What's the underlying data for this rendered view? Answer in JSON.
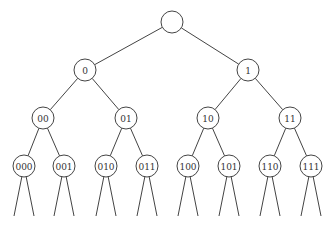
{
  "diagram": {
    "type": "binary-tree",
    "node_radius": 11,
    "nodes": [
      {
        "id": "root",
        "label": "",
        "x": 172,
        "y": 22
      },
      {
        "id": "0",
        "label": "0",
        "x": 85,
        "y": 70
      },
      {
        "id": "1",
        "label": "1",
        "x": 248,
        "y": 70
      },
      {
        "id": "00",
        "label": "00",
        "x": 43,
        "y": 118
      },
      {
        "id": "01",
        "label": "01",
        "x": 126,
        "y": 118
      },
      {
        "id": "10",
        "label": "10",
        "x": 208,
        "y": 118
      },
      {
        "id": "11",
        "label": "11",
        "x": 290,
        "y": 118
      },
      {
        "id": "000",
        "label": "000",
        "x": 24,
        "y": 166
      },
      {
        "id": "001",
        "label": "001",
        "x": 64,
        "y": 166
      },
      {
        "id": "010",
        "label": "010",
        "x": 106,
        "y": 166
      },
      {
        "id": "011",
        "label": "011",
        "x": 147,
        "y": 166
      },
      {
        "id": "100",
        "label": "100",
        "x": 188,
        "y": 166
      },
      {
        "id": "101",
        "label": "101",
        "x": 229,
        "y": 166
      },
      {
        "id": "110",
        "label": "110",
        "x": 270,
        "y": 166
      },
      {
        "id": "111",
        "label": "111",
        "x": 311,
        "y": 166
      }
    ],
    "edges": [
      [
        "root",
        "0"
      ],
      [
        "root",
        "1"
      ],
      [
        "0",
        "00"
      ],
      [
        "0",
        "01"
      ],
      [
        "1",
        "10"
      ],
      [
        "1",
        "11"
      ],
      [
        "00",
        "000"
      ],
      [
        "00",
        "001"
      ],
      [
        "01",
        "010"
      ],
      [
        "01",
        "011"
      ],
      [
        "10",
        "100"
      ],
      [
        "10",
        "101"
      ],
      [
        "11",
        "110"
      ],
      [
        "11",
        "111"
      ]
    ],
    "open_leaf_lines": {
      "spread": 10,
      "end_y": 216
    }
  }
}
